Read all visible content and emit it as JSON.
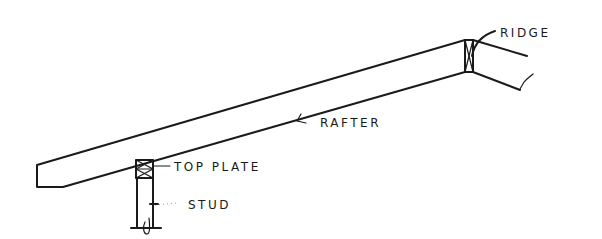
{
  "diagram": {
    "type": "framing-sketch",
    "labels": {
      "ridge": "RIDGE",
      "rafter": "RAFTER",
      "top_plate": "TOP PLATE",
      "stud": "STUD"
    },
    "colors": {
      "ink": "#1a1a1a",
      "background": "#ffffff"
    }
  }
}
